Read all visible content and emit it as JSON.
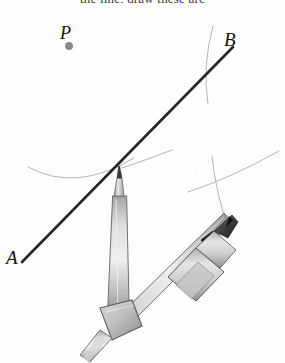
{
  "figure": {
    "title_fragment": "the line, draw these arc",
    "background_color": "#fefefe",
    "labels": {
      "point_p": "P",
      "point_b": "B",
      "point_a": "A"
    },
    "colors": {
      "line_ab": "#262626",
      "arc": "#b4b4b4",
      "point_dot": "#8a8a8a",
      "metal_light": "#e2e2e2",
      "metal_mid": "#b9b9b9",
      "metal_dark": "#8e8e8e",
      "metal_outline": "#5a5a5a",
      "pencil_tip": "#2b2b2b",
      "clamp": "#1c1c1c",
      "label_text": "#111111"
    },
    "elements": {
      "line_ab": {
        "name": "line through A and B",
        "x1": 22,
        "y1": 262,
        "x2": 233,
        "y2": 47
      },
      "point_p": {
        "name": "marked point P",
        "cx": 69,
        "cy": 46,
        "r": 4
      },
      "needle_point": {
        "name": "compass needle point on line AB",
        "cx": 119,
        "cy": 167
      },
      "pencil_point": {
        "name": "compass pencil point",
        "cx": 229,
        "cy": 214
      },
      "arcs": [
        {
          "name": "left arc swept through needle point"
        },
        {
          "name": "short arc right of needle point"
        },
        {
          "name": "upper right vertical arc near B"
        },
        {
          "name": "lower right arc through pencil point"
        }
      ],
      "compass": {
        "name": "drawing compass",
        "left_leg": "needle leg",
        "right_leg": "pencil leg",
        "hinge": "pivot joint",
        "pencil_clamp": "clamp band"
      }
    }
  }
}
